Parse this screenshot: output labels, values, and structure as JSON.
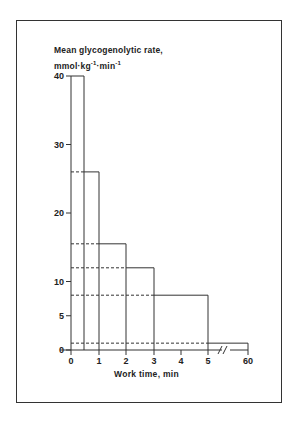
{
  "chart_data": {
    "type": "bar",
    "title": "",
    "ylabel_line1": "Mean glycogenolytic rate,",
    "ylabel_line2": "mmol·kg⁻¹·min⁻¹",
    "xlabel": "Work time, min",
    "ylim": [
      0,
      40
    ],
    "yticks": [
      0,
      5,
      10,
      20,
      30,
      40
    ],
    "xticks": [
      "0",
      "1",
      "2",
      "3",
      "4",
      "5",
      "60"
    ],
    "axis_break": "between 5 and 60",
    "bars": [
      {
        "x_start": 0,
        "x_end": 0.5,
        "value": 40
      },
      {
        "x_start": 0,
        "x_end": 1,
        "value": 26
      },
      {
        "x_start": 0,
        "x_end": 2,
        "value": 15.5
      },
      {
        "x_start": 0,
        "x_end": 3,
        "value": 12
      },
      {
        "x_start": 0,
        "x_end": 5,
        "value": 8
      },
      {
        "x_start": 0,
        "x_end": 60,
        "value": 1
      }
    ],
    "grid": false,
    "legend": null
  }
}
